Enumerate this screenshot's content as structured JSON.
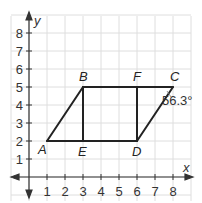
{
  "diagram": {
    "type": "coordinate-geometry",
    "colors": {
      "grid": "#dedede",
      "axis": "#333333",
      "shape": "#222222",
      "text": "#333333"
    },
    "axes": {
      "x_label": "x",
      "y_label": "y",
      "x_ticks": [
        "1",
        "2",
        "3",
        "4",
        "5",
        "6",
        "7",
        "8"
      ],
      "y_ticks": [
        "1",
        "2",
        "3",
        "4",
        "5",
        "6",
        "7",
        "8"
      ]
    },
    "points": [
      {
        "name": "A",
        "x": 1,
        "y": 2
      },
      {
        "name": "B",
        "x": 3,
        "y": 5
      },
      {
        "name": "C",
        "x": 8,
        "y": 5
      },
      {
        "name": "D",
        "x": 6,
        "y": 2
      },
      {
        "name": "E",
        "x": 3,
        "y": 2
      },
      {
        "name": "F",
        "x": 6,
        "y": 5
      }
    ],
    "segments": [
      [
        "A",
        "B"
      ],
      [
        "B",
        "C"
      ],
      [
        "C",
        "D"
      ],
      [
        "D",
        "A"
      ],
      [
        "B",
        "E"
      ],
      [
        "F",
        "D"
      ]
    ],
    "angle_annotation": {
      "vertex": "C",
      "label": "56.3°"
    }
  }
}
